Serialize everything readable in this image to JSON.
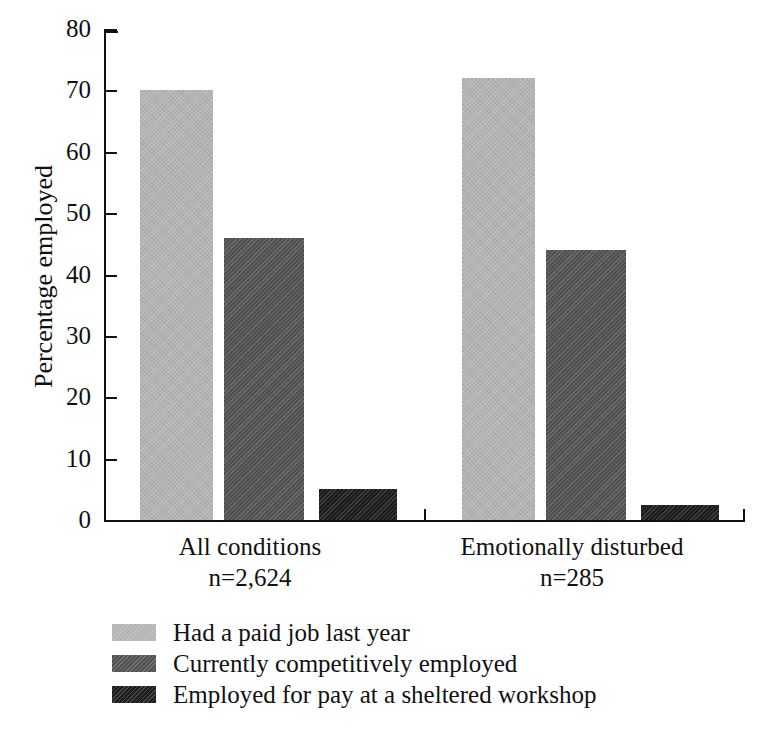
{
  "chart_data": {
    "type": "bar",
    "title": "",
    "xlabel": "",
    "ylabel": "Percentage employed",
    "ylim": [
      0,
      80
    ],
    "ytick_labels": [
      "0",
      "10",
      "20",
      "30",
      "40",
      "50",
      "60",
      "70",
      "80"
    ],
    "ytick_values": [
      0,
      10,
      20,
      30,
      40,
      50,
      60,
      70,
      80
    ],
    "grid": false,
    "legend_position": "below-left",
    "categories": [
      "All conditions",
      "Emotionally disturbed"
    ],
    "category_sublabels": [
      "n=2,624",
      "n=285"
    ],
    "series": [
      {
        "name": "Had a paid job last year",
        "values": [
          70,
          72
        ],
        "color": "#b4b4b4"
      },
      {
        "name": "Currently competitively employed",
        "values": [
          46,
          44
        ],
        "color": "#525252"
      },
      {
        "name": "Employed for pay at a sheltered workshop",
        "values": [
          5,
          2.5
        ],
        "color": "#1c1c1c"
      }
    ]
  },
  "legend": {
    "items": [
      {
        "label": "Had a paid job last year"
      },
      {
        "label": "Currently competitively employed"
      },
      {
        "label": "Employed for pay at a sheltered workshop"
      }
    ]
  },
  "axes": {
    "y_title": "Percentage employed"
  }
}
